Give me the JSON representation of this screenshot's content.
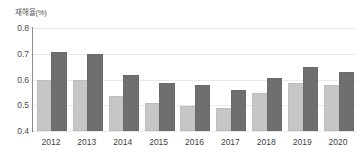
{
  "axis": {
    "y_unit_label": "재해율(%)",
    "y_ticks": [
      "0.8",
      "0.7",
      "0.6",
      "0.5",
      "0.4"
    ],
    "x_ticks": [
      "2012",
      "2013",
      "2014",
      "2015",
      "2016",
      "2017",
      "2018",
      "2019",
      "2020"
    ]
  },
  "colors": {
    "series_a": "#c6c6c6",
    "series_b": "#6f6f6f",
    "gridline": "#e9e9e9",
    "axis": "#5d5d5d",
    "background": "#ffffff"
  },
  "chart_data": {
    "type": "bar",
    "title": "",
    "subtitle": "",
    "xlabel": "",
    "ylabel": "재해율(%)",
    "ylim": [
      0.4,
      0.8
    ],
    "yticks": [
      0.4,
      0.5,
      0.6,
      0.7,
      0.8
    ],
    "grid": true,
    "legend": null,
    "categories": [
      "2012",
      "2013",
      "2014",
      "2015",
      "2016",
      "2017",
      "2018",
      "2019",
      "2020"
    ],
    "series": [
      {
        "name": "series-a",
        "color": "#c6c6c6",
        "values": [
          0.59,
          0.59,
          0.53,
          0.5,
          0.49,
          0.48,
          0.54,
          0.58,
          0.57
        ]
      },
      {
        "name": "series-b",
        "color": "#6f6f6f",
        "values": [
          0.7,
          0.69,
          0.61,
          0.58,
          0.57,
          0.55,
          0.6,
          0.64,
          0.62
        ]
      }
    ]
  }
}
